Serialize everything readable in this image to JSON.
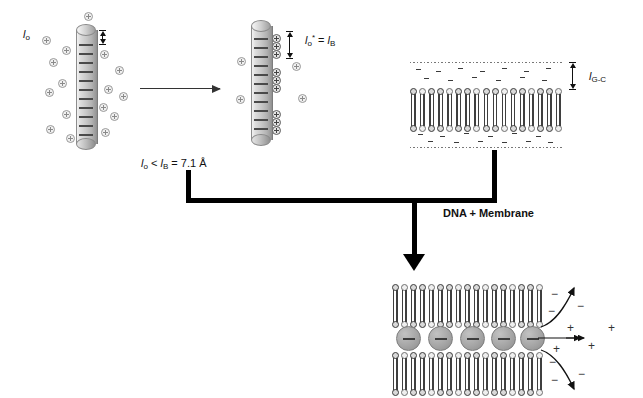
{
  "diagram": {
    "labels": {
      "l0": "l",
      "l0_sub": "o",
      "l0_star_main": "l",
      "l0_star_sub": "o",
      "l0_star_sup": "*",
      "l0_star_eq": " = ",
      "lB_main": "l",
      "lB_sub": "B",
      "condition_full": "l o  <  l B  =  7.1 Å",
      "condition_pre": "l",
      "condition_pre_sub": "o",
      "condition_mid": " < ",
      "condition_lB": "l",
      "condition_lB_sub": "B",
      "condition_post": " = 7.1 Å",
      "lGC_main": "l",
      "lGC_sub": "G-C",
      "dna_membrane": "DNA + Membrane"
    },
    "charges": {
      "plus": "+",
      "minus": "−"
    },
    "icons": {
      "reaction_arrow": "reaction-arrow-icon",
      "measure_arrow": "double-headed-measure-arrow-icon",
      "bracket_arrow": "bold-down-arrow-icon",
      "curve_arrow": "curved-release-arrow-icon"
    },
    "colors": {
      "rod_fill": "#c9c9c9",
      "dna_sphere": "#a3a3a3",
      "lipid_head": "#d9d9d9",
      "line": "#000000",
      "charge_gray": "#8a8a8a"
    },
    "counts": {
      "left_rod_free_ions": 16,
      "right_rod_bound_ions": 9,
      "dna_spheres": 5,
      "bilayers_bottom": 2
    },
    "released": {
      "minus_top_outer": "−",
      "minus_top_inner": "−",
      "minus_mid_upper": "−",
      "plus_mid_a": "+",
      "plus_mid_b": "+",
      "plus_mid_c": "+",
      "plus_far": "+",
      "minus_bot_inner": "−",
      "minus_bot_outer": "−",
      "minus_low": "−"
    }
  }
}
